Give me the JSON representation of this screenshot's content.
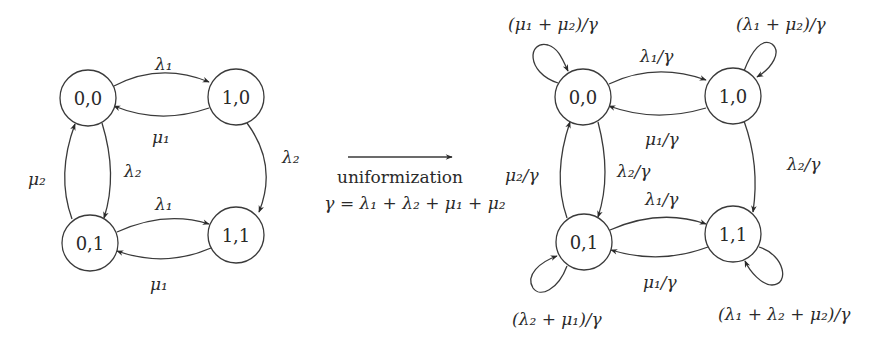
{
  "left_diagram": {
    "nodes": [
      {
        "id": "00",
        "label": "0,0",
        "cx": 88,
        "cy": 98
      },
      {
        "id": "10",
        "label": "1,0",
        "cx": 236,
        "cy": 97
      },
      {
        "id": "01",
        "label": "0,1",
        "cx": 90,
        "cy": 243
      },
      {
        "id": "11",
        "label": "1,1",
        "cx": 236,
        "cy": 235
      }
    ],
    "edge_labels": {
      "e00_10": "λ₁",
      "e10_00": "μ₁",
      "e00_01": "λ₂",
      "e01_00": "μ₂",
      "e10_11": "λ₂",
      "e01_11": "λ₁",
      "e11_01": "μ₁"
    }
  },
  "transform": {
    "arrow": "→",
    "label": "uniformization",
    "formula": "γ = λ₁ + λ₂ + μ₁ + μ₂"
  },
  "right_diagram": {
    "nodes": [
      {
        "id": "00",
        "label": "0,0",
        "cx": 583,
        "cy": 97
      },
      {
        "id": "10",
        "label": "1,0",
        "cx": 733,
        "cy": 96
      },
      {
        "id": "01",
        "label": "0,1",
        "cx": 584,
        "cy": 242
      },
      {
        "id": "11",
        "label": "1,1",
        "cx": 733,
        "cy": 234
      }
    ],
    "edge_labels": {
      "e00_10": "λ₁/γ",
      "e10_00": "μ₁/γ",
      "e00_01": "λ₂/γ",
      "e01_00": "μ₂/γ",
      "e10_11": "λ₂/γ",
      "e01_11": "λ₁/γ",
      "e11_01": "μ₁/γ"
    },
    "self_loops": {
      "s00": "(μ₁ + μ₂)/γ",
      "s10": "(λ₁ + μ₂)/γ",
      "s01": "(λ₂ + μ₁)/γ",
      "s11": "(λ₁ + λ₂ + μ₂)/γ"
    }
  }
}
